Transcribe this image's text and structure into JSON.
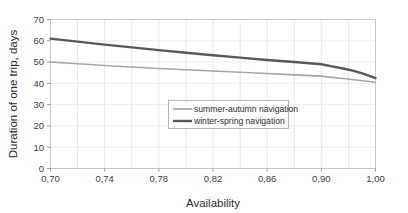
{
  "chart_data": {
    "type": "line",
    "title": "",
    "xlabel": "Availability",
    "ylabel": "Duration of one trip, days",
    "xlim": [
      0.7,
      1.0
    ],
    "ylim": [
      0,
      70
    ],
    "grid": true,
    "legend_position": "center",
    "x_tick_labels": [
      "0,70",
      "0,74",
      "0,78",
      "0,82",
      "0,86",
      "0,90",
      "1,00"
    ],
    "x_tick_values": [
      0.7,
      0.74,
      0.78,
      0.82,
      0.86,
      0.9,
      1.0
    ],
    "y_tick_labels": [
      "0",
      "10",
      "20",
      "30",
      "40",
      "50",
      "60",
      "70"
    ],
    "y_tick_values": [
      0,
      10,
      20,
      30,
      40,
      50,
      60,
      70
    ],
    "x": [
      0.7,
      0.72,
      0.74,
      0.76,
      0.78,
      0.8,
      0.82,
      0.84,
      0.86,
      0.88,
      0.9,
      0.92,
      0.94,
      0.96,
      0.98,
      1.0
    ],
    "series": [
      {
        "name": "summer-autumn navigation",
        "color": "#a6a6a6",
        "width": 1.6,
        "values": [
          50.0,
          49.2,
          48.4,
          47.7,
          47.0,
          46.4,
          45.8,
          45.2,
          44.6,
          44.0,
          43.4,
          42.8,
          42.3,
          41.7,
          41.1,
          40.5
        ]
      },
      {
        "name": "winter-spring navigation",
        "color": "#595959",
        "width": 2.4,
        "values": [
          61.0,
          59.6,
          58.2,
          56.9,
          55.6,
          54.4,
          53.2,
          52.1,
          51.0,
          50.0,
          49.0,
          48.0,
          47.0,
          45.9,
          44.3,
          42.5
        ]
      }
    ]
  },
  "legend": {
    "entries": [
      {
        "label": "summer-autumn navigation"
      },
      {
        "label": "winter-spring navigation"
      }
    ]
  },
  "axes": {
    "x_title": "Availability",
    "y_title": "Duration of one trip, days"
  }
}
